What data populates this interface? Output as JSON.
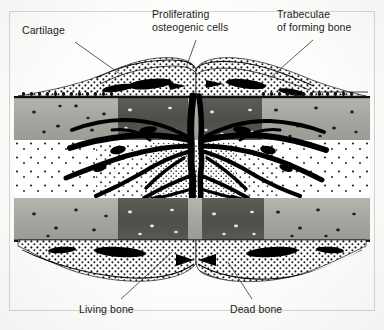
{
  "figure": {
    "background_color": "#fdfdfc",
    "frame_color": "#787878",
    "width": 384,
    "height": 330
  },
  "labels": [
    {
      "id": "cartilage",
      "text": "Cartilage",
      "position": "top-left",
      "leader_from": [
        75,
        42
      ],
      "leader_to": [
        118,
        72
      ]
    },
    {
      "id": "proliferating-osteogenic-cells",
      "text": "Proliferating\nosteogenic cells",
      "position": "top-center",
      "leader_from": [
        196,
        38
      ],
      "leader_to": [
        186,
        66
      ]
    },
    {
      "id": "trabeculae-of-forming-bone",
      "text": "Trabeculae\nof forming bone",
      "position": "top-right",
      "leader_from": [
        313,
        38
      ],
      "leader_to": [
        268,
        76
      ]
    },
    {
      "id": "living-bone",
      "text": "Living bone",
      "position": "bottom-left",
      "leader_from": [
        121,
        300
      ],
      "leader_to": [
        170,
        252
      ]
    },
    {
      "id": "dead-bone",
      "text": "Dead bone",
      "position": "bottom-right",
      "leader_from": [
        252,
        300
      ],
      "leader_to": [
        228,
        262
      ]
    }
  ],
  "structures": {
    "cortical_bone": {
      "name": "Living bone cortex",
      "fill": "#a9a9a4",
      "description": "Pale grey cortical bone shafts with dark osteocyte lacunae"
    },
    "dead_bone": {
      "name": "Dead bone fragment ends",
      "fill": "#54544f",
      "description": "Darker grey bone adjacent to the fracture line with empty white lacunae"
    },
    "trabeculae": {
      "name": "Trabeculae of forming bone",
      "fill": "#000000",
      "description": "Black branching woven bone spicules radiating from the fracture gap"
    },
    "cartilage_cap": {
      "name": "Cartilage",
      "fill": "#ffffff",
      "description": "Stippled external callus caps above and below the cortices"
    },
    "osteogenic_layer": {
      "name": "Proliferating osteogenic cells",
      "fill": "#2a2a2a",
      "description": "Dense cellular stippled layer at the periosteal surface"
    },
    "marrow": {
      "name": "Marrow / granulation tissue",
      "fill": "#ffffff",
      "description": "Speckled region between the two cortices"
    }
  },
  "colors": {
    "ink": "#1b1b1b",
    "leader_line": "#4a4a4a",
    "bone_light": "#a9a9a4",
    "bone_dark": "#54544f",
    "trabecula": "#000000"
  }
}
